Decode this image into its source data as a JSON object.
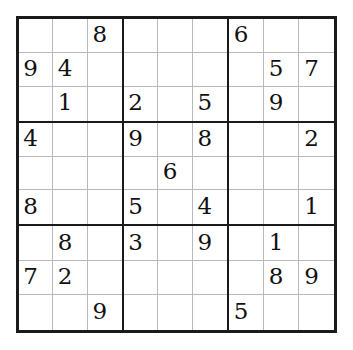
{
  "puzzle": {
    "type": "sudoku",
    "title": "Sudoku Puzzle",
    "size": 9,
    "box_rows": 3,
    "box_cols": 3,
    "empty_symbol": "",
    "colors": {
      "background": "#ffffff",
      "outer_border": "#1a1a1a",
      "block_border": "#1a1a1a",
      "cell_border": "#b9b9b9",
      "digit": "#111111"
    },
    "givens_count": 27,
    "rows": [
      {
        "index": 1,
        "cells": [
          "",
          "",
          "8",
          "",
          "",
          "",
          "6",
          "",
          ""
        ]
      },
      {
        "index": 2,
        "cells": [
          "9",
          "4",
          "",
          "",
          "",
          "",
          "",
          "5",
          "7"
        ]
      },
      {
        "index": 3,
        "cells": [
          "",
          "1",
          "",
          "2",
          "",
          "5",
          "",
          "9",
          ""
        ]
      },
      {
        "index": 4,
        "cells": [
          "4",
          "",
          "",
          "9",
          "",
          "8",
          "",
          "",
          "2"
        ]
      },
      {
        "index": 5,
        "cells": [
          "",
          "",
          "",
          "",
          "6",
          "",
          "",
          "",
          ""
        ]
      },
      {
        "index": 6,
        "cells": [
          "8",
          "",
          "",
          "5",
          "",
          "4",
          "",
          "",
          "1"
        ]
      },
      {
        "index": 7,
        "cells": [
          "",
          "8",
          "",
          "3",
          "",
          "9",
          "",
          "1",
          ""
        ]
      },
      {
        "index": 8,
        "cells": [
          "7",
          "2",
          "",
          "",
          "",
          "",
          "",
          "8",
          "9"
        ]
      },
      {
        "index": 9,
        "cells": [
          "",
          "",
          "9",
          "",
          "",
          "",
          "5",
          "",
          ""
        ]
      }
    ]
  }
}
